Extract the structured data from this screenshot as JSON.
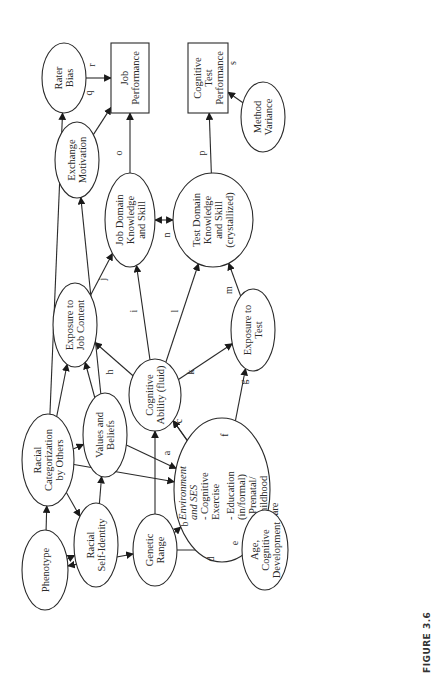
{
  "figure": {
    "caption": "FIGURE 3.6"
  },
  "nodes": {
    "rater_bias": {
      "lines": [
        "Rater",
        "Bias"
      ],
      "shape": "ellipse"
    },
    "job_performance": {
      "lines": [
        "Job",
        "Performance"
      ],
      "shape": "rectangle"
    },
    "exchange_motivation": {
      "lines": [
        "Exchange",
        "Motivation"
      ],
      "shape": "ellipse"
    },
    "cognitive_test_performance": {
      "lines": [
        "Cognitive",
        "Test",
        "Performance"
      ],
      "shape": "rectangle"
    },
    "method_variance": {
      "lines": [
        "Method",
        "Variance"
      ],
      "shape": "ellipse"
    },
    "job_domain_knowledge": {
      "lines": [
        "Job Domain",
        "Knowledge",
        "and Skill"
      ],
      "shape": "ellipse"
    },
    "test_domain_knowledge": {
      "lines": [
        "Test Domain",
        "Knowledge",
        "and Skill",
        "(crystallized)"
      ],
      "shape": "ellipse"
    },
    "exposure_job_content": {
      "lines": [
        "Exposure to",
        "Job Content"
      ],
      "shape": "ellipse"
    },
    "exposure_test": {
      "lines": [
        "Exposure to",
        "Test"
      ],
      "shape": "ellipse"
    },
    "cognitive_ability": {
      "lines": [
        "Cognitive",
        "Ability (fluid)"
      ],
      "shape": "ellipse"
    },
    "values_beliefs": {
      "lines": [
        "Values and",
        "Beliefs"
      ],
      "shape": "ellipse"
    },
    "racial_categorization": {
      "lines": [
        "Racial",
        "Categorization",
        "by Others"
      ],
      "shape": "ellipse"
    },
    "environment_ses": {
      "title_lines": [
        "Environment",
        "and SES"
      ],
      "lines": [
        "- Cognitive",
        "Exercise",
        "- Education",
        "(in/formal)",
        "- Prenatal/",
        "Childhood",
        "care"
      ],
      "shape": "ellipse"
    },
    "racial_self_identity": {
      "lines": [
        "Racial",
        "Self-Identity"
      ],
      "shape": "ellipse"
    },
    "phenotype": {
      "lines": [
        "Phenotype"
      ],
      "shape": "ellipse"
    },
    "genetic_range": {
      "lines": [
        "Genetic",
        "Range"
      ],
      "shape": "ellipse"
    },
    "age_development": {
      "lines": [
        "Age,",
        "Cognitive",
        "Development"
      ],
      "shape": "ellipse"
    }
  },
  "edges": [
    {
      "from": "values_beliefs",
      "to": "environment_ses",
      "label": "a"
    },
    {
      "from": "genetic_range",
      "to": "environment_ses",
      "label": "b"
    },
    {
      "from": "environment_ses",
      "to": "cognitive_ability",
      "label": "c"
    },
    {
      "from": "genetic_range",
      "to": "age_development",
      "label": "d"
    },
    {
      "from": "environment_ses",
      "to": "age_development",
      "label": "e",
      "bidirectional": true
    },
    {
      "from": "age_development",
      "to": "cognitive_ability",
      "label": "f"
    },
    {
      "from": "environment_ses",
      "to": "exposure_test",
      "label": "g"
    },
    {
      "from": "cognitive_ability",
      "to": "exposure_job_content",
      "label": "h"
    },
    {
      "from": "cognitive_ability",
      "to": "job_domain_knowledge",
      "label": "i"
    },
    {
      "from": "exposure_job_content",
      "to": "job_domain_knowledge",
      "label": "j"
    },
    {
      "from": "cognitive_ability",
      "to": "exposure_test",
      "label": "k"
    },
    {
      "from": "cognitive_ability",
      "to": "test_domain_knowledge",
      "label": "l"
    },
    {
      "from": "exposure_test",
      "to": "test_domain_knowledge",
      "label": "m"
    },
    {
      "from": "job_domain_knowledge",
      "to": "test_domain_knowledge",
      "label": "n",
      "bidirectional": true
    },
    {
      "from": "job_domain_knowledge",
      "to": "job_performance",
      "label": "o"
    },
    {
      "from": "test_domain_knowledge",
      "to": "cognitive_test_performance",
      "label": "p"
    },
    {
      "from": "exchange_motivation",
      "to": "job_performance",
      "label": "q"
    },
    {
      "from": "rater_bias",
      "to": "job_performance",
      "label": "r"
    },
    {
      "from": "method_variance",
      "to": "cognitive_test_performance",
      "label": "s"
    },
    {
      "from": "phenotype",
      "to": "racial_categorization",
      "label": ""
    },
    {
      "from": "phenotype",
      "to": "racial_self_identity",
      "label": ""
    },
    {
      "from": "phenotype",
      "to": "genetic_range",
      "label": "",
      "bidirectional": true
    },
    {
      "from": "racial_categorization",
      "to": "racial_self_identity",
      "label": ""
    },
    {
      "from": "racial_categorization",
      "to": "values_beliefs",
      "label": ""
    },
    {
      "from": "racial_categorization",
      "to": "environment_ses",
      "label": ""
    },
    {
      "from": "racial_categorization",
      "to": "exposure_job_content",
      "label": ""
    },
    {
      "from": "racial_categorization",
      "to": "rater_bias",
      "label": ""
    },
    {
      "from": "racial_self_identity",
      "to": "values_beliefs",
      "label": ""
    },
    {
      "from": "values_beliefs",
      "to": "exposure_job_content",
      "label": ""
    },
    {
      "from": "values_beliefs",
      "to": "exchange_motivation",
      "label": ""
    },
    {
      "from": "genetic_range",
      "to": "cognitive_ability",
      "label": ""
    }
  ]
}
